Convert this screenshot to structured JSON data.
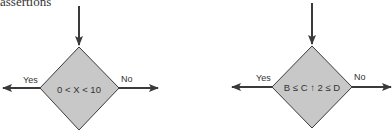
{
  "heading": "assertions",
  "colors": {
    "diamond_fill": "#c8c8c8",
    "stroke": "#3a3a3a",
    "background": "#ffffff"
  },
  "diagrams": [
    {
      "condition": "0 < X < 10",
      "yes_label": "Yes",
      "no_label": "No"
    },
    {
      "condition": "B ≤ C ↑ 2 ≤ D",
      "yes_label": "Yes",
      "no_label": "No"
    }
  ]
}
